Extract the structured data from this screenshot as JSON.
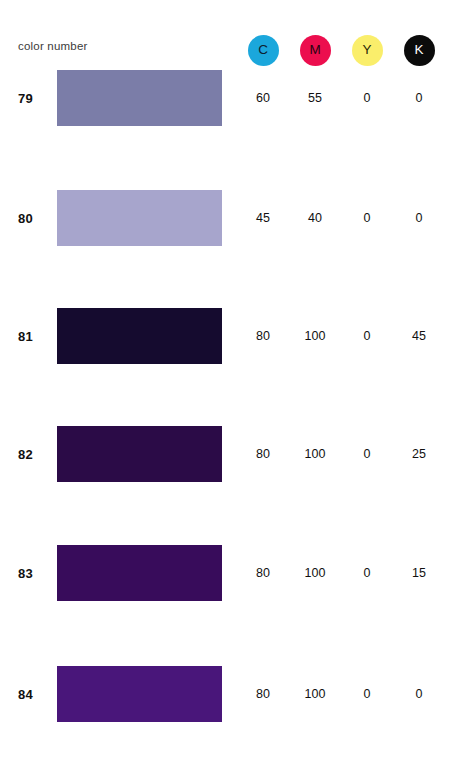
{
  "header": {
    "label": "color number",
    "inks": [
      {
        "name": "cyan",
        "letter": "C",
        "circle_color": "#1BA7DC",
        "text_color": "#0d2030"
      },
      {
        "name": "magenta",
        "letter": "M",
        "circle_color": "#EC0E4E",
        "text_color": "#2a0410"
      },
      {
        "name": "yellow",
        "letter": "Y",
        "circle_color": "#FAEE6B",
        "text_color": "#2a2708"
      },
      {
        "name": "black",
        "letter": "K",
        "circle_color": "#0B0B0B",
        "text_color": "#ffffff"
      }
    ]
  },
  "chart_data": {
    "type": "table",
    "title": "color number",
    "columns": [
      "color number",
      "swatch",
      "C",
      "M",
      "Y",
      "K"
    ],
    "rows": [
      {
        "number": "79",
        "swatch_hex": "#7B7DA8",
        "c": "60",
        "m": "55",
        "y": "0",
        "k": "0"
      },
      {
        "number": "80",
        "swatch_hex": "#A7A5CC",
        "c": "45",
        "m": "40",
        "y": "0",
        "k": "0"
      },
      {
        "number": "81",
        "swatch_hex": "#150B2F",
        "c": "80",
        "m": "100",
        "y": "0",
        "k": "45"
      },
      {
        "number": "82",
        "swatch_hex": "#2B0B47",
        "c": "80",
        "m": "100",
        "y": "0",
        "k": "25"
      },
      {
        "number": "83",
        "swatch_hex": "#380C5B",
        "c": "80",
        "m": "100",
        "y": "0",
        "k": "15"
      },
      {
        "number": "84",
        "swatch_hex": "#49167A",
        "c": "80",
        "m": "100",
        "y": "0",
        "k": "0"
      }
    ]
  },
  "layout": {
    "row_tops": [
      70,
      190,
      308,
      426,
      545,
      666
    ]
  }
}
